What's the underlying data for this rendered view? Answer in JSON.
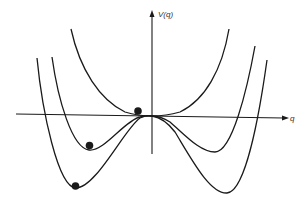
{
  "diagram": {
    "type": "potential-energy-curves",
    "axes": {
      "y_label": "V(q)",
      "x_label": "q"
    },
    "curves": [
      {
        "name": "single-well",
        "description": "quartic minimum at q=0"
      },
      {
        "name": "shallow-double-well",
        "description": "local maximum at q=0, two shallow minima"
      },
      {
        "name": "deep-double-well",
        "description": "local maximum at q=0, two deep minima"
      }
    ],
    "balls": [
      {
        "position": "near origin on single-well curve"
      },
      {
        "position": "left minimum of shallow double well"
      },
      {
        "position": "left minimum of deep double well"
      }
    ],
    "colors": {
      "stroke": "#1a1a1a",
      "background": "#ffffff"
    }
  }
}
